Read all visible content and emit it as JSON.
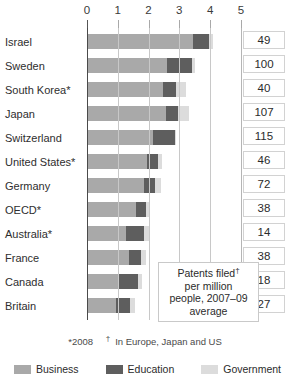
{
  "chart_data": {
    "type": "bar",
    "subtype": "horizontal-stacked",
    "title": "",
    "xlabel": "",
    "ylabel": "",
    "xlim": [
      0,
      5
    ],
    "xticks": [
      0,
      1,
      2,
      3,
      4,
      5
    ],
    "xtick_labels": [
      "0",
      "1",
      "2",
      "3",
      "4",
      "5"
    ],
    "grid": true,
    "legend_position": "bottom",
    "categories": [
      "Israel",
      "Sweden",
      "South Korea*",
      "Japan",
      "Switzerland",
      "United States*",
      "Germany",
      "OECD*",
      "Australia*",
      "France",
      "Canada",
      "Britain"
    ],
    "series": [
      {
        "name": "Business",
        "color": "#a9a9a9",
        "values": [
          3.45,
          2.6,
          2.48,
          2.55,
          2.15,
          1.95,
          1.85,
          1.58,
          1.25,
          1.35,
          1.05,
          0.95
        ]
      },
      {
        "name": "Education",
        "color": "#5e5e5e",
        "values": [
          0.5,
          0.8,
          0.42,
          0.4,
          0.7,
          0.35,
          0.35,
          0.32,
          0.6,
          0.4,
          0.6,
          0.45
        ]
      },
      {
        "name": "Government",
        "color": "#dcdcdc",
        "values": [
          0.15,
          0.1,
          0.3,
          0.35,
          0.05,
          0.15,
          0.2,
          0.15,
          0.15,
          0.15,
          0.15,
          0.15
        ]
      }
    ],
    "totals": [
      4.1,
      3.5,
      3.2,
      3.3,
      2.9,
      2.45,
      2.4,
      2.05,
      2.0,
      1.9,
      1.8,
      1.55
    ],
    "side_column": {
      "header": "",
      "values": [
        49,
        100,
        40,
        107,
        115,
        46,
        72,
        38,
        14,
        38,
        18,
        27
      ]
    },
    "annotation": {
      "line1": "Patents filed",
      "line1_marker": "†",
      "line2": "per million",
      "line3": "people, 2007–09",
      "line4": "average"
    },
    "footnotes": {
      "note1": "*2008",
      "note2_marker": "†",
      "note2": "In Europe, Japan and US"
    },
    "legend": [
      {
        "label": "Business",
        "color": "#a9a9a9"
      },
      {
        "label": "Education",
        "color": "#5e5e5e"
      },
      {
        "label": "Government",
        "color": "#dcdcdc"
      }
    ]
  }
}
